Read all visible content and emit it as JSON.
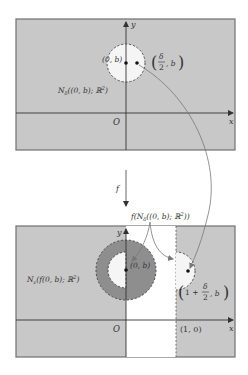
{
  "colors": {
    "panel_bg": "#c8c8c8",
    "panel_border": "#707070",
    "white_region": "#ffffff",
    "neighborhood_fill": "#f5f5f5",
    "outer_ring": "#8e8e8e",
    "axis": "#333333",
    "curve": "#777777",
    "text": "#333333"
  },
  "top_panel": {
    "y_axis_label": "y",
    "x_axis_label": "x",
    "origin_label": "O",
    "point_label": "(0, b)",
    "shifted_point_label_num": "δ",
    "shifted_point_label_den": "2",
    "shifted_point_label_tail": ", b",
    "neighborhood_label": "N",
    "neighborhood_sub": "δ",
    "neighborhood_args": "((0, b); ℝ",
    "neighborhood_sup": "2",
    "neighborhood_close": ")"
  },
  "map": {
    "label": "f"
  },
  "bottom_panel": {
    "y_axis_label": "y",
    "x_axis_label": "x",
    "origin_label": "O",
    "unit_label": "(1, 0)",
    "point_label": "(0, b)",
    "image_label": "f(N",
    "image_sub": "δ",
    "image_args": "((0, b); ℝ",
    "image_sup": "2",
    "image_close": "))",
    "eps_label": "N",
    "eps_sub": "ε",
    "eps_args": "(f(0, b); ℝ",
    "eps_sup": "2",
    "eps_close": ")",
    "shifted_point_pre": "1 + ",
    "shifted_point_num": "δ",
    "shifted_point_den": "2",
    "shifted_point_tail": ", b"
  }
}
